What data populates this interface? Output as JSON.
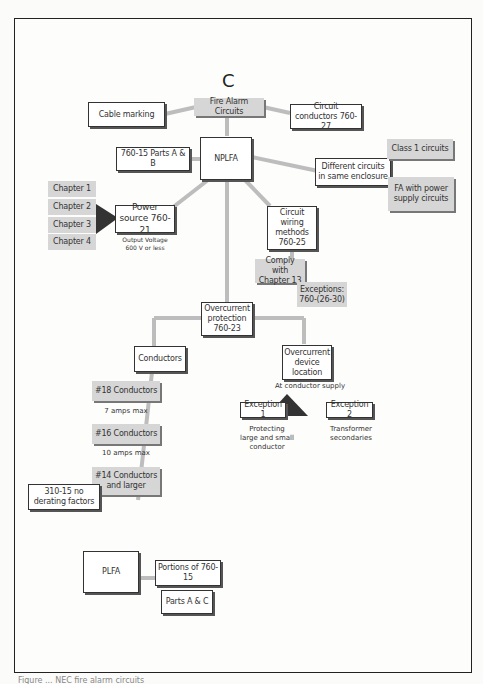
{
  "diagram": {
    "title": "C",
    "root": "Fire Alarm Circuits",
    "top_left": "Cable marking",
    "top_right": "Circuit conductors 760-27",
    "nplfa": "NPLFA",
    "parts_ab": "760-15 Parts A & B",
    "different_circuits": "Different circuits in same enclosure",
    "class1": "Class 1 circuits",
    "fa_power": "FA with power supply circuits",
    "chapters": [
      "Chapter 1",
      "Chapter 2",
      "Chapter 3",
      "Chapter 4"
    ],
    "power_source": "Power source 760-21",
    "output_voltage": "Output Voltage 600 V or less",
    "wiring_methods": "Circuit wiring methods 760-25",
    "comply": "Comply with Chapter 13",
    "exceptions": "Exceptions: 760-(26-30)",
    "overcurrent_protection": "Overcurrent protection 760-23",
    "conductors": "Conductors",
    "oc_device_location": "Overcurrent device location",
    "at_conductor_supply": "At conductor supply",
    "exception1": "Exception 1",
    "exception2": "Exception 2",
    "exception1_note": "Protecting large and small conductor",
    "exception2_note": "Transformer secondaries",
    "c18": "#18 Conductors",
    "c18_note": "7 amps max",
    "c16": "#16 Conductors",
    "c16_note": "10 amps max",
    "c14": "#14 Conductors and larger",
    "no_derating": "310-15 no derating factors",
    "plfa": "PLFA",
    "portions": "Portions of 760-15",
    "parts_ac": "Parts A & C"
  },
  "colors": {
    "line": "#bdbdbd",
    "gray_box": "#d6d6d6",
    "arrow": "#333333"
  },
  "footer": "Figure ... NEC fire alarm circuits"
}
